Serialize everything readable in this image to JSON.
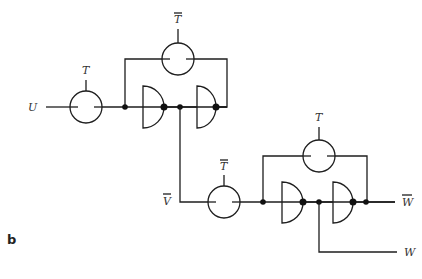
{
  "figure": {
    "panel_label": "b",
    "signals": {
      "input": "U",
      "intermediate": "V",
      "output_inverted": "W",
      "output": "W"
    },
    "controls": {
      "stage1_input_switch": "T",
      "stage1_feedback_switch": "T",
      "stage2_input_switch": "T",
      "stage2_feedback_switch": "T"
    },
    "overbars": {
      "stage1_input_switch": false,
      "stage1_feedback_switch": true,
      "stage2_input_switch": true,
      "stage2_feedback_switch": false,
      "intermediate": true,
      "output_inverted": true,
      "output": false
    },
    "colors": {
      "line": "#1e1e1e",
      "text": "#333333",
      "background": "#ffffff"
    }
  }
}
